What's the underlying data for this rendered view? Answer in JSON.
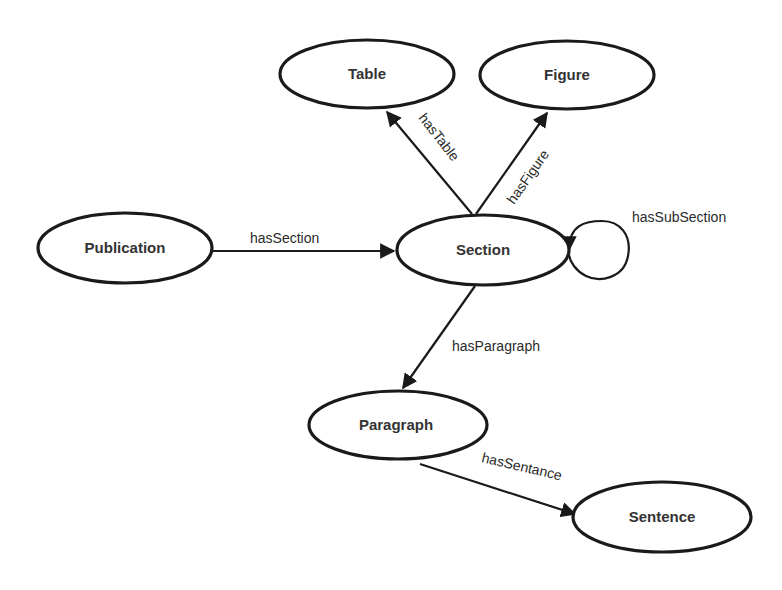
{
  "diagram": {
    "nodes": [
      {
        "id": "table",
        "label": "Table",
        "cx": 367,
        "cy": 74,
        "rx": 87,
        "ry": 34
      },
      {
        "id": "figure",
        "label": "Figure",
        "cx": 567,
        "cy": 75,
        "rx": 87,
        "ry": 34
      },
      {
        "id": "publication",
        "label": "Publication",
        "cx": 125,
        "cy": 248,
        "rx": 87,
        "ry": 35
      },
      {
        "id": "section",
        "label": "Section",
        "cx": 483,
        "cy": 250,
        "rx": 86,
        "ry": 35
      },
      {
        "id": "paragraph",
        "label": "Paragraph",
        "cx": 398,
        "cy": 425,
        "rx": 89,
        "ry": 34
      },
      {
        "id": "sentence",
        "label": "Sentence",
        "cx": 662,
        "cy": 517,
        "rx": 89,
        "ry": 35
      }
    ],
    "edges": [
      {
        "id": "hasTable",
        "label": "hasTable",
        "from": "section",
        "to": "table"
      },
      {
        "id": "hasFigure",
        "label": "hasFigure",
        "from": "section",
        "to": "figure"
      },
      {
        "id": "hasSection",
        "label": "hasSection",
        "from": "publication",
        "to": "section"
      },
      {
        "id": "hasSubSection",
        "label": "hasSubSection",
        "from": "section",
        "to": "section"
      },
      {
        "id": "hasParagraph",
        "label": "hasParagraph",
        "from": "section",
        "to": "paragraph"
      },
      {
        "id": "hasSentance",
        "label": "hasSentance",
        "from": "paragraph",
        "to": "sentence"
      }
    ]
  }
}
